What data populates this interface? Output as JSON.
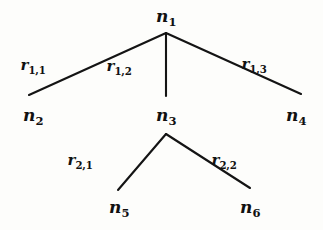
{
  "figure": {
    "kind": "tree-diagram",
    "background_color": "#fdfdfb",
    "stroke_color": "#141414",
    "text_color": "#111111"
  },
  "nodes": [
    {
      "id": "n1",
      "base": "n",
      "sub": "1",
      "x": 166,
      "y": 16,
      "label": "n1"
    },
    {
      "id": "n2",
      "base": "n",
      "sub": "2",
      "x": 33,
      "y": 115,
      "label": "n2"
    },
    {
      "id": "n3",
      "base": "n",
      "sub": "3",
      "x": 166,
      "y": 115,
      "label": "n3"
    },
    {
      "id": "n4",
      "base": "n",
      "sub": "4",
      "x": 296,
      "y": 115,
      "label": "n4"
    },
    {
      "id": "n5",
      "base": "n",
      "sub": "5",
      "x": 119,
      "y": 207,
      "label": "n5"
    },
    {
      "id": "n6",
      "base": "n",
      "sub": "6",
      "x": 250,
      "y": 207,
      "label": "n6"
    }
  ],
  "edges": [
    {
      "id": "e11",
      "from": "n1",
      "to": "n2",
      "x1": 166,
      "y1": 33,
      "x2": 29,
      "y2": 95
    },
    {
      "id": "e12",
      "from": "n1",
      "to": "n3",
      "x1": 166,
      "y1": 33,
      "x2": 166,
      "y2": 96
    },
    {
      "id": "e13",
      "from": "n1",
      "to": "n4",
      "x1": 166,
      "y1": 33,
      "x2": 301,
      "y2": 94
    },
    {
      "id": "e21",
      "from": "n3",
      "to": "n5",
      "x1": 166,
      "y1": 134,
      "x2": 118,
      "y2": 190
    },
    {
      "id": "e22",
      "from": "n3",
      "to": "n6",
      "x1": 166,
      "y1": 134,
      "x2": 250,
      "y2": 188
    }
  ],
  "edge_labels": [
    {
      "id": "r11",
      "base": "r",
      "sub": "1,1",
      "x": 33,
      "y": 65,
      "label": "r1,1",
      "edge": "e11"
    },
    {
      "id": "r12",
      "base": "r",
      "sub": "1,2",
      "x": 119,
      "y": 66,
      "label": "r1,2",
      "edge": "e12"
    },
    {
      "id": "r13",
      "base": "r",
      "sub": "1,3",
      "x": 254,
      "y": 64,
      "label": "r1,3",
      "edge": "e13"
    },
    {
      "id": "r21",
      "base": "r",
      "sub": "2,1",
      "x": 80,
      "y": 160,
      "label": "r2,1",
      "edge": "e21"
    },
    {
      "id": "r22",
      "base": "r",
      "sub": "2,2",
      "x": 224,
      "y": 160,
      "label": "r2,2",
      "edge": "e22"
    }
  ]
}
